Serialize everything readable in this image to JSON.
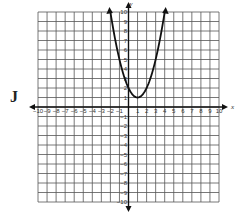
{
  "option_label": "J",
  "chart_data": {
    "type": "line",
    "title": "",
    "xlabel": "x",
    "ylabel": "y",
    "xlim": [
      -10,
      10
    ],
    "ylim": [
      -10,
      10
    ],
    "grid": true,
    "x_ticks": [
      -10,
      -9,
      -8,
      -7,
      -6,
      -5,
      -4,
      -3,
      -2,
      -1,
      1,
      2,
      3,
      4,
      5,
      6,
      7,
      8,
      9,
      10
    ],
    "y_ticks": [
      -10,
      -9,
      -8,
      -7,
      -6,
      -5,
      -4,
      -3,
      -2,
      -1,
      1,
      2,
      3,
      4,
      5,
      6,
      7,
      8,
      9,
      10
    ],
    "series": [
      {
        "name": "parabola",
        "equation": "y = (x - 1)^2 + 1",
        "vertex": [
          1,
          1
        ],
        "x": [
          -2,
          -1.5,
          -1,
          -0.5,
          0,
          0.5,
          1,
          1.5,
          2,
          2.5,
          3,
          3.5,
          4
        ],
        "values": [
          10,
          7.25,
          5,
          3.25,
          2,
          1.25,
          1,
          1.25,
          2,
          3.25,
          5,
          7.25,
          10
        ],
        "arrows_at_ends": true
      }
    ]
  }
}
